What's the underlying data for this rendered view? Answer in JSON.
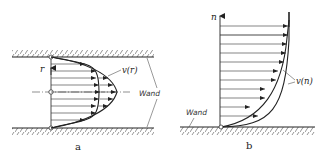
{
  "panel_a": {
    "caption": "a",
    "axis_label": "r",
    "profile_label": "v(r)",
    "wall_label": "Wand"
  },
  "panel_b": {
    "caption": "b",
    "axis_label": "n",
    "profile_label": "v(n)",
    "wall_label": "Wand"
  },
  "colors": {
    "stroke": "#222222",
    "hatch": "#555555"
  }
}
